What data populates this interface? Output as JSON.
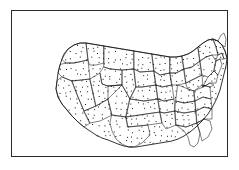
{
  "figure": {
    "kind": "dot-density-map",
    "region": "Contiguous United States",
    "width": 239,
    "height": 170,
    "background_color": "#ffffff",
    "frame": {
      "x": 11,
      "y": 10,
      "width": 217,
      "height": 147,
      "border_color": "#2b2b2b",
      "border_width": 1.3
    },
    "symbology": {
      "dot_color": "#151515",
      "dot_size_px": 1,
      "state_border_color": "#1a1a1a",
      "coastline_color": "#111111",
      "fill_color": "#ffffff"
    }
  },
  "chart_data": {
    "type": "map",
    "title": "",
    "subtitle": "",
    "xlabel": "",
    "ylabel": "",
    "legend": [],
    "annotations": [],
    "grid": false,
    "projection_hint": "albers-equal-area-conic",
    "map_extent": {
      "left": 0,
      "top": 0,
      "right": 217,
      "bottom": 147
    },
    "national_outline": "M 50 48 L 48 54 L 46 62 L 45 70 L 44 78 L 46 86 L 50 93 L 55 99 L 60 105 L 66 111 L 72 116 L 78 120 L 84 124 L 90 127 L 96 129 L 101 131 L 106 133 L 112 135 L 118 136 L 124 136 L 130 135 L 136 134 L 142 133 L 148 132 L 154 131 L 160 130 L 166 128 L 172 125 L 178 121 L 184 116 L 190 110 L 196 103 L 201 95 L 205 87 L 208 79 L 210 71 L 212 63 L 214 55 L 215 47 L 213 40 L 210 34 L 206 30 L 201 28 L 196 29 L 191 32 L 186 36 L 181 40 L 176 43 L 170 45 L 164 46 L 158 46 L 152 45 L 146 44 L 140 43 L 134 42 L 128 41 L 122 40 L 116 39 L 110 38 L 104 37 L 98 36 L 92 35 L 86 34 L 80 33 L 74 32 L 68 32 L 62 34 L 56 38 L 52 43 Z",
    "states": [
      {
        "code": "WA",
        "name": "Washington"
      },
      {
        "code": "OR",
        "name": "Oregon"
      },
      {
        "code": "CA",
        "name": "California"
      },
      {
        "code": "NV",
        "name": "Nevada"
      },
      {
        "code": "ID",
        "name": "Idaho"
      },
      {
        "code": "MT",
        "name": "Montana"
      },
      {
        "code": "WY",
        "name": "Wyoming"
      },
      {
        "code": "UT",
        "name": "Utah"
      },
      {
        "code": "AZ",
        "name": "Arizona"
      },
      {
        "code": "NM",
        "name": "New Mexico"
      },
      {
        "code": "CO",
        "name": "Colorado"
      },
      {
        "code": "ND",
        "name": "North Dakota"
      },
      {
        "code": "SD",
        "name": "South Dakota"
      },
      {
        "code": "NE",
        "name": "Nebraska"
      },
      {
        "code": "KS",
        "name": "Kansas"
      },
      {
        "code": "OK",
        "name": "Oklahoma"
      },
      {
        "code": "TX",
        "name": "Texas"
      },
      {
        "code": "MN",
        "name": "Minnesota"
      },
      {
        "code": "IA",
        "name": "Iowa"
      },
      {
        "code": "MO",
        "name": "Missouri"
      },
      {
        "code": "AR",
        "name": "Arkansas"
      },
      {
        "code": "LA",
        "name": "Louisiana"
      },
      {
        "code": "WI",
        "name": "Wisconsin"
      },
      {
        "code": "IL",
        "name": "Illinois"
      },
      {
        "code": "MI",
        "name": "Michigan"
      },
      {
        "code": "IN",
        "name": "Indiana"
      },
      {
        "code": "OH",
        "name": "Ohio"
      },
      {
        "code": "KY",
        "name": "Kentucky"
      },
      {
        "code": "TN",
        "name": "Tennessee"
      },
      {
        "code": "MS",
        "name": "Mississippi"
      },
      {
        "code": "AL",
        "name": "Alabama"
      },
      {
        "code": "GA",
        "name": "Georgia"
      },
      {
        "code": "FL",
        "name": "Florida"
      },
      {
        "code": "SC",
        "name": "South Carolina"
      },
      {
        "code": "NC",
        "name": "North Carolina"
      },
      {
        "code": "VA",
        "name": "Virginia"
      },
      {
        "code": "WV",
        "name": "West Virginia"
      },
      {
        "code": "MD",
        "name": "Maryland"
      },
      {
        "code": "DE",
        "name": "Delaware"
      },
      {
        "code": "PA",
        "name": "Pennsylvania"
      },
      {
        "code": "NJ",
        "name": "New Jersey"
      },
      {
        "code": "NY",
        "name": "New York"
      },
      {
        "code": "CT",
        "name": "Connecticut"
      },
      {
        "code": "RI",
        "name": "Rhode Island"
      },
      {
        "code": "MA",
        "name": "Massachusetts"
      },
      {
        "code": "VT",
        "name": "Vermont"
      },
      {
        "code": "NH",
        "name": "New Hampshire"
      },
      {
        "code": "ME",
        "name": "Maine"
      }
    ],
    "state_borders": [
      "M 50 48 L 56 38 L 62 34 L 68 32 L 74 32 L 76 49 L 62 52 L 54 52 Z",
      "M 54 52 L 62 52 L 76 49 L 78 68 L 60 70 L 50 66 L 46 62 L 48 54 Z",
      "M 50 66 L 60 70 L 66 86 L 72 100 L 78 112 L 72 116 L 66 111 L 60 105 L 55 99 L 50 93 L 46 86 L 44 78 L 45 70 Z",
      "M 60 70 L 78 68 L 84 95 L 72 100 L 66 86 Z",
      "M 76 49 L 74 32 L 80 33 L 86 34 L 92 35 L 92 52 L 84 54 L 78 54 Z",
      "M 92 35 L 98 36 L 104 37 L 110 38 L 116 39 L 122 40 L 122 58 L 110 59 L 98 58 L 92 56 Z",
      "M 92 56 L 98 58 L 110 59 L 110 74 L 96 75 L 90 73 L 88 62 Z",
      "M 78 68 L 88 62 L 90 73 L 96 75 L 96 88 L 84 95 Z",
      "M 72 100 L 84 95 L 96 88 L 100 104 L 88 110 L 78 112 Z",
      "M 96 88 L 110 74 L 118 88 L 114 106 L 100 104 Z",
      "M 96 75 L 110 74 L 110 59 L 122 58 L 124 76 L 118 88 L 110 74 Z",
      "M 122 40 L 128 41 L 134 42 L 140 43 L 142 60 L 128 61 L 122 58 Z",
      "M 122 58 L 128 61 L 142 60 L 144 74 L 130 76 L 124 76 Z",
      "M 124 76 L 130 76 L 144 74 L 146 88 L 132 90 L 118 88 Z",
      "M 118 88 L 132 90 L 146 88 L 148 101 L 134 103 L 114 106 Z",
      "M 114 106 L 134 103 L 148 101 L 150 112 L 136 114 L 116 116 Z",
      "M 100 104 L 114 106 L 116 116 L 136 114 L 138 124 L 130 132 L 122 136 L 116 136 L 110 133 L 104 128 L 100 120 L 98 112 Z",
      "M 140 43 L 146 44 L 152 45 L 158 46 L 158 62 L 148 64 L 142 60 Z",
      "M 142 60 L 148 64 L 158 62 L 160 74 L 150 76 L 144 74 Z",
      "M 144 74 L 150 76 L 160 74 L 162 88 L 152 90 L 146 88 Z",
      "M 146 88 L 152 90 L 162 88 L 163 100 L 152 102 L 148 101 Z",
      "M 148 101 L 152 102 L 163 100 L 164 114 L 154 118 L 150 112 Z",
      "M 158 46 L 164 46 L 170 45 L 172 58 L 164 62 L 158 62 Z",
      "M 158 62 L 164 62 L 172 58 L 174 72 L 166 74 L 160 74 Z",
      "M 170 45 L 176 43 L 181 40 L 186 36 L 188 50 L 180 56 L 172 58 Z",
      "M 172 58 L 180 56 L 188 50 L 190 64 L 182 68 L 174 72 Z",
      "M 174 72 L 182 68 L 190 64 L 191 76 L 182 80 L 176 78 Z",
      "M 166 74 L 176 78 L 182 80 L 183 90 L 172 92 L 164 90 Z",
      "M 164 90 L 172 92 L 183 90 L 184 100 L 172 102 L 163 100 Z",
      "M 163 100 L 172 102 L 184 100 L 185 112 L 174 116 L 164 114 Z",
      "M 164 114 L 174 116 L 185 112 L 188 122 L 186 132 L 182 136 L 178 134 L 176 126 L 172 120 Z",
      "M 185 112 L 192 108 L 198 110 L 200 118 L 196 126 L 190 130 L 188 122 Z",
      "M 184 100 L 192 96 L 200 98 L 200 108 L 192 108 L 185 112 Z",
      "M 183 90 L 191 86 L 199 88 L 200 98 L 192 96 L 184 100 Z",
      "M 182 80 L 190 74 L 198 76 L 199 88 L 191 86 L 183 90 Z",
      "M 191 76 L 198 72 L 202 74 L 198 76 L 190 74 Z",
      "M 188 50 L 194 46 L 200 44 L 204 50 L 202 60 L 196 66 L 190 64 Z",
      "M 196 66 L 202 60 L 206 64 L 204 72 L 198 72 L 191 76 Z",
      "M 186 36 L 191 32 L 196 29 L 201 28 L 204 36 L 206 44 L 200 44 L 194 46 L 188 50 Z",
      "M 204 50 L 208 48 L 210 54 L 206 64 L 202 60 Z",
      "M 206 44 L 210 42 L 212 48 L 208 48 L 204 50 Z",
      "M 201 28 L 206 30 L 210 34 L 213 40 L 215 47 L 212 48 L 210 42 L 206 44 L 204 36 Z",
      "M 206 30 L 209 24 L 212 22 L 214 28 L 213 36 L 210 34 Z"
    ],
    "dot_spacing_px": 5.6,
    "dot_jitter_px": 1.8,
    "dot_count_approx": 980
  }
}
